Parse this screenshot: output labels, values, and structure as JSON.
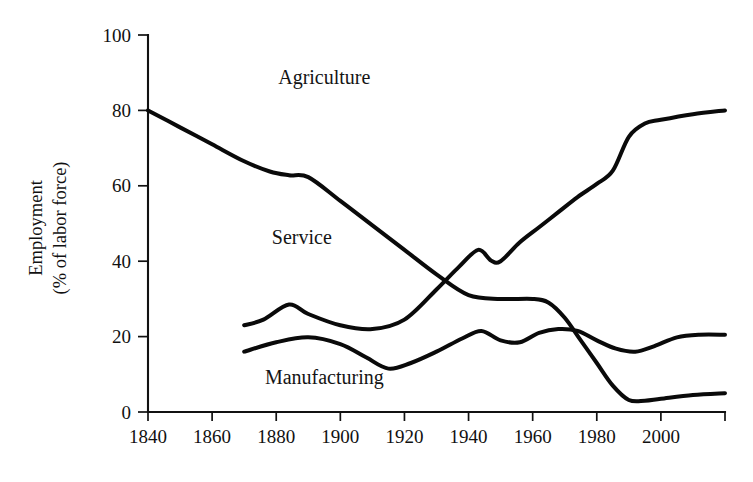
{
  "chart_data": {
    "type": "line",
    "title": "",
    "subtitle": "",
    "xlabel": "",
    "ylabel": "Employment\n(% of labor force)",
    "ylabel_line1": "Employment",
    "ylabel_line2": "(% of labor force)",
    "xlim": [
      1840,
      2020
    ],
    "ylim": [
      0,
      100
    ],
    "grid": false,
    "legend_position": "inline-annotations",
    "x_ticks": [
      1840,
      1860,
      1880,
      1900,
      1920,
      1940,
      1960,
      1980,
      2000,
      2020
    ],
    "x_tick_labels": [
      "1840",
      "1860",
      "1880",
      "1900",
      "1920",
      "1940",
      "1960",
      "1980",
      "2000",
      ""
    ],
    "y_ticks": [
      0,
      20,
      40,
      60,
      80,
      100
    ],
    "y_tick_labels": [
      "0",
      "20",
      "40",
      "60",
      "80",
      "100"
    ],
    "annotations": [
      {
        "text": "Agriculture",
        "x": 1895,
        "y": 87
      },
      {
        "text": "Service",
        "x": 1888,
        "y": 44.5
      },
      {
        "text": "Manufacturing",
        "x": 1895,
        "y": 7.5
      }
    ],
    "series": [
      {
        "name": "Agriculture",
        "x": [
          1840,
          1850,
          1860,
          1870,
          1878,
          1884,
          1890,
          1900,
          1910,
          1920,
          1930,
          1940,
          1950,
          1960,
          1965,
          1970,
          1975,
          1980,
          1985,
          1990,
          1995,
          2000,
          2010,
          2020
        ],
        "values": [
          80.0,
          75.5,
          71.0,
          66.5,
          63.8,
          62.8,
          62.3,
          56.0,
          49.5,
          43.0,
          36.5,
          31.0,
          30.0,
          30.0,
          29.0,
          25.0,
          19.0,
          13.0,
          7.0,
          3.2,
          3.0,
          3.5,
          4.5,
          5.0
        ]
      },
      {
        "name": "Service",
        "x": [
          1870,
          1876,
          1884,
          1890,
          1900,
          1910,
          1920,
          1930,
          1937,
          1943,
          1947,
          1950,
          1956,
          1962,
          1968,
          1974,
          1980,
          1985,
          1990,
          1995,
          2000,
          2010,
          2020
        ],
        "values": [
          23.0,
          24.5,
          28.5,
          26.0,
          23.0,
          22.0,
          24.5,
          32.5,
          38.5,
          43.0,
          40.2,
          40.0,
          45.0,
          49.0,
          53.0,
          57.0,
          60.5,
          64.0,
          73.0,
          76.5,
          77.5,
          79.0,
          80.0
        ]
      },
      {
        "name": "Manufacturing",
        "x": [
          1870,
          1880,
          1890,
          1900,
          1908,
          1915,
          1922,
          1930,
          1938,
          1944,
          1950,
          1956,
          1962,
          1968,
          1974,
          1980,
          1986,
          1992,
          1998,
          2005,
          2012,
          2020
        ],
        "values": [
          16.0,
          18.5,
          19.8,
          18.0,
          14.5,
          11.5,
          13.0,
          16.0,
          19.5,
          21.5,
          19.0,
          18.5,
          21.0,
          22.0,
          21.5,
          19.0,
          16.8,
          16.0,
          17.5,
          19.8,
          20.5,
          20.5
        ]
      }
    ]
  },
  "plot_geometry": {
    "left": 148,
    "right": 725,
    "top": 35,
    "bottom": 412
  }
}
